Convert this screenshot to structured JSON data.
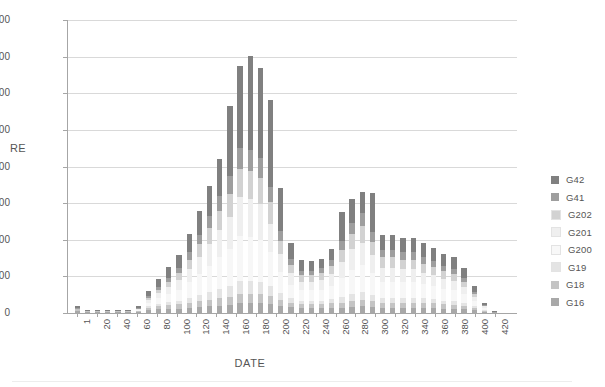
{
  "chart_data": {
    "type": "bar",
    "stacked": true,
    "title": "",
    "xlabel": "DATE",
    "ylabel": "RE",
    "ylim": [
      0,
      800
    ],
    "ytick_labels": [
      "0",
      "100",
      "200",
      "300",
      "400",
      "500",
      "600",
      "700",
      "800"
    ],
    "ytick_values": [
      0,
      100,
      200,
      300,
      400,
      500,
      600,
      700,
      800
    ],
    "grid": true,
    "legend_position": "right",
    "xtick_labels": [
      "1",
      "20",
      "40",
      "60",
      "80",
      "100",
      "120",
      "140",
      "160",
      "180",
      "200",
      "220",
      "240",
      "260",
      "280",
      "300",
      "320",
      "340",
      "360",
      "380",
      "400",
      "420"
    ],
    "xtick_values": [
      1,
      20,
      40,
      60,
      80,
      100,
      120,
      140,
      160,
      180,
      200,
      220,
      240,
      260,
      280,
      300,
      320,
      340,
      360,
      380,
      400,
      420
    ],
    "categories": [
      1,
      11,
      21,
      31,
      41,
      51,
      61,
      71,
      81,
      91,
      101,
      111,
      121,
      131,
      141,
      151,
      161,
      171,
      181,
      191,
      201,
      211,
      221,
      231,
      241,
      251,
      261,
      271,
      281,
      291,
      301,
      311,
      321,
      331,
      341,
      351,
      361,
      371,
      381,
      391,
      401,
      411
    ],
    "colors": {
      "G42": "#808080",
      "G41": "#9e9e9e",
      "G202": "#d2d2d2",
      "G201": "#efefef",
      "G200": "#f7f7f7",
      "G19": "#e4e4e4",
      "G18": "#c4c4c4",
      "G16": "#a8a8a8"
    },
    "series": [
      {
        "name": "G16",
        "values": [
          6,
          4,
          4,
          4,
          4,
          4,
          4,
          8,
          10,
          12,
          12,
          14,
          16,
          18,
          20,
          22,
          26,
          26,
          26,
          24,
          20,
          16,
          14,
          14,
          14,
          14,
          14,
          16,
          18,
          16,
          14,
          14,
          14,
          14,
          14,
          14,
          12,
          12,
          10,
          8,
          4,
          2
        ]
      },
      {
        "name": "G18",
        "values": [
          4,
          2,
          2,
          2,
          2,
          2,
          2,
          6,
          8,
          10,
          12,
          14,
          16,
          18,
          20,
          22,
          26,
          26,
          26,
          22,
          16,
          12,
          10,
          10,
          10,
          12,
          14,
          16,
          18,
          16,
          14,
          14,
          14,
          14,
          14,
          12,
          12,
          10,
          10,
          6,
          2,
          0
        ]
      },
      {
        "name": "G19",
        "values": [
          2,
          0,
          0,
          0,
          0,
          0,
          0,
          4,
          6,
          8,
          10,
          14,
          18,
          22,
          26,
          30,
          36,
          36,
          34,
          28,
          18,
          12,
          10,
          10,
          10,
          12,
          16,
          20,
          22,
          18,
          14,
          14,
          14,
          14,
          12,
          12,
          10,
          10,
          8,
          4,
          2,
          0
        ]
      },
      {
        "name": "G200",
        "values": [
          0,
          0,
          0,
          0,
          0,
          0,
          2,
          10,
          16,
          22,
          30,
          42,
          56,
          70,
          86,
          100,
          122,
          120,
          114,
          92,
          58,
          36,
          28,
          28,
          30,
          36,
          52,
          66,
          72,
          58,
          44,
          44,
          42,
          42,
          38,
          36,
          32,
          30,
          24,
          14,
          6,
          0
        ]
      },
      {
        "name": "G201",
        "values": [
          0,
          0,
          0,
          0,
          0,
          0,
          2,
          8,
          14,
          20,
          26,
          36,
          48,
          60,
          74,
          88,
          106,
          104,
          98,
          78,
          50,
          32,
          24,
          24,
          26,
          32,
          44,
          56,
          62,
          50,
          38,
          38,
          36,
          36,
          32,
          30,
          28,
          26,
          20,
          12,
          4,
          0
        ]
      },
      {
        "name": "G202",
        "values": [
          0,
          0,
          0,
          0,
          0,
          0,
          2,
          6,
          10,
          14,
          18,
          26,
          34,
          44,
          54,
          64,
          78,
          76,
          72,
          58,
          36,
          24,
          18,
          18,
          18,
          22,
          32,
          42,
          46,
          36,
          28,
          28,
          26,
          26,
          24,
          22,
          20,
          18,
          14,
          8,
          2,
          0
        ]
      },
      {
        "name": "G41",
        "values": [
          2,
          0,
          0,
          0,
          0,
          0,
          2,
          4,
          6,
          10,
          14,
          20,
          26,
          32,
          40,
          48,
          58,
          56,
          54,
          42,
          26,
          16,
          12,
          12,
          14,
          16,
          24,
          30,
          34,
          26,
          20,
          20,
          20,
          20,
          18,
          16,
          14,
          14,
          10,
          6,
          2,
          0
        ]
      },
      {
        "name": "G42",
        "values": [
          4,
          2,
          2,
          2,
          2,
          2,
          6,
          14,
          22,
          30,
          36,
          50,
          66,
          82,
          100,
          190,
          222,
          258,
          244,
          238,
          118,
          44,
          28,
          26,
          26,
          32,
          80,
          66,
          58,
          108,
          42,
          42,
          40,
          40,
          38,
          36,
          34,
          32,
          26,
          16,
          6,
          4
        ]
      }
    ]
  },
  "legend": {
    "items": [
      {
        "label": "G42",
        "color": "#808080"
      },
      {
        "label": "G41",
        "color": "#9e9e9e"
      },
      {
        "label": "G202",
        "color": "#d2d2d2"
      },
      {
        "label": "G201",
        "color": "#efefef"
      },
      {
        "label": "G200",
        "color": "#f8f8f8"
      },
      {
        "label": "G19",
        "color": "#e4e4e4"
      },
      {
        "label": "G18",
        "color": "#c4c4c4"
      },
      {
        "label": "G16",
        "color": "#a8a8a8"
      }
    ]
  }
}
